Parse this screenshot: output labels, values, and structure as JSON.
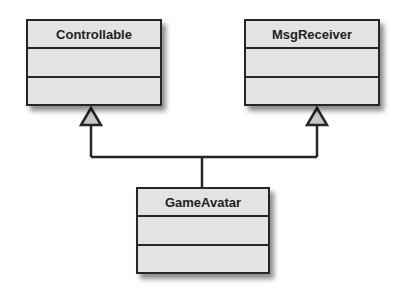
{
  "diagram": {
    "type": "uml-class-diagram",
    "classes": [
      {
        "name": "Controllable",
        "attributes": [],
        "operations": []
      },
      {
        "name": "MsgReceiver",
        "attributes": [],
        "operations": []
      },
      {
        "name": "GameAvatar",
        "attributes": [],
        "operations": []
      }
    ],
    "relationships": [
      {
        "type": "generalization",
        "from": "GameAvatar",
        "to": "Controllable"
      },
      {
        "type": "generalization",
        "from": "GameAvatar",
        "to": "MsgReceiver"
      }
    ]
  },
  "colors": {
    "class_fill": "#e3e3e3",
    "line": "#262626",
    "arrowhead_fill": "#c8c8c8"
  }
}
